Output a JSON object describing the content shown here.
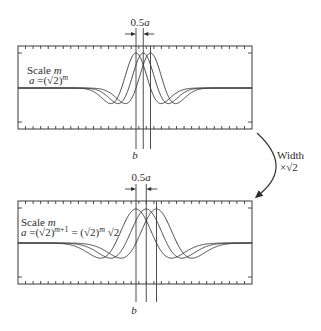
{
  "figure": {
    "background": "#ffffff",
    "ink": "#333333"
  },
  "panels": [
    {
      "name": "scale-m",
      "title": {
        "word": "Scale",
        "var": "m"
      },
      "formula": {
        "var_a": "a",
        "rhs": " =(√2)",
        "exp": "m"
      },
      "spacing_label": {
        "coef": "0.5",
        "var": "a"
      },
      "position_label": "b",
      "wavelet": {
        "type": "mexican-hat",
        "count": 3,
        "shift": "0.5a",
        "width_factor": 1,
        "b_px": 136,
        "a_px": 14.5
      }
    },
    {
      "name": "scale-m-plus-1",
      "title": {
        "word": "Scale",
        "var": "m"
      },
      "formula": {
        "var_a": "a",
        "rhs": " =(√2)",
        "exp_var": "m",
        "exp_suffix": "+1",
        "rhs2": " = (√2)",
        "exp2": "m",
        "tail": " √2"
      },
      "spacing_label": {
        "coef": "0.5",
        "var": "a"
      },
      "position_label": "b",
      "wavelet": {
        "type": "mexican-hat",
        "count": 3,
        "shift": "0.5a",
        "width_factor": 1.4142,
        "b_px": 136,
        "a_px": 20.5
      }
    }
  ],
  "transition": {
    "icon": "curved-arrow-icon",
    "line1": "Width",
    "line2": "×√2"
  }
}
